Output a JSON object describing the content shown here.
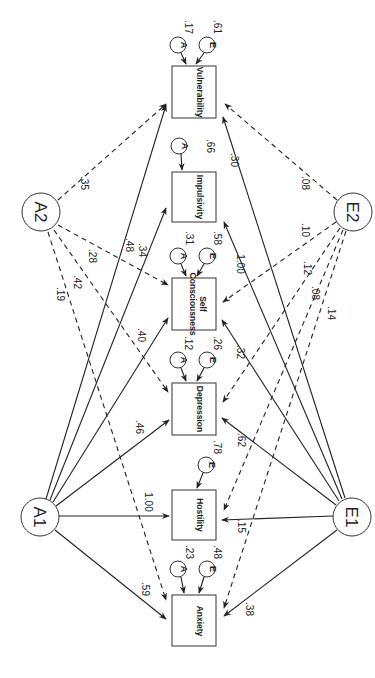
{
  "diagram": {
    "type": "path-diagram",
    "orientation": "rotated-90",
    "latents": [
      {
        "id": "A1",
        "label": "A1"
      },
      {
        "id": "A2",
        "label": "A2"
      },
      {
        "id": "E1",
        "label": "E1"
      },
      {
        "id": "E2",
        "label": "E2"
      }
    ],
    "observed": [
      {
        "id": "vulnerability",
        "label": "Vulnerability",
        "A": "A",
        "A_value": ".17",
        "E": "E",
        "E_value": ".61"
      },
      {
        "id": "impulsivity",
        "label": "Impulsivity",
        "A": "A",
        "A_value": ".66"
      },
      {
        "id": "self_consciousness",
        "label_line1": "Self",
        "label_line2": "Consciousness",
        "A": "A",
        "A_value": ".31",
        "E": "E",
        "E_value": ".58"
      },
      {
        "id": "depression",
        "label": "Depression",
        "A": "A",
        "A_value": ".12",
        "E": "E",
        "E_value": ".26"
      },
      {
        "id": "hostility",
        "label": "Hostility",
        "E": "E",
        "E_value": ".78"
      },
      {
        "id": "anxiety",
        "label": "Anxiety",
        "A": "A",
        "A_value": ".23",
        "E": "E",
        "E_value": ".48"
      }
    ],
    "paths": {
      "A1_to_vulnerability": ".48",
      "A1_to_impulsivity": ".34",
      "A1_to_self_consciousness": ".40",
      "A1_to_depression": ".46",
      "A1_to_hostility": "1.00",
      "A1_to_anxiety": ".59",
      "A2_to_vulnerability": ".35",
      "A2_to_self_consciousness": ".28",
      "A2_to_depression": ".42",
      "A2_to_anxiety": ".19",
      "E1_to_vulnerability": ".30",
      "E1_to_impulsivity": "1.00",
      "E1_to_self_consciousness": ".32",
      "E1_to_depression": ".62",
      "E1_to_hostility": ".15",
      "E1_to_anxiety": ".38",
      "E2_to_vulnerability": ".08",
      "E2_to_self_consciousness": ".10",
      "E2_to_depression": ".12",
      "E2_to_hostility": ".08",
      "E2_to_anxiety": ".14"
    }
  }
}
